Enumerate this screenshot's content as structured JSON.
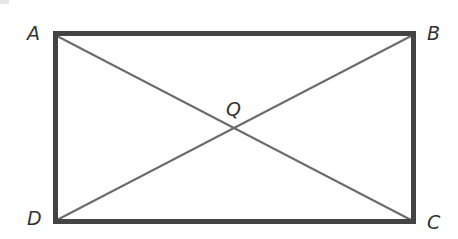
{
  "diagram": {
    "type": "geometry",
    "shape": "rectangle",
    "colors": {
      "border": "#444444",
      "diagonal": "#6b6b6b",
      "label": "#333333",
      "background": "#ffffff"
    },
    "vertices": [
      {
        "name": "A",
        "x": 53,
        "y": 33
      },
      {
        "name": "B",
        "x": 415,
        "y": 33
      },
      {
        "name": "C",
        "x": 415,
        "y": 223
      },
      {
        "name": "D",
        "x": 53,
        "y": 223
      }
    ],
    "intersection": {
      "name": "Q",
      "x": 234,
      "y": 128
    },
    "segments": [
      {
        "from": "A",
        "to": "B",
        "kind": "side"
      },
      {
        "from": "B",
        "to": "C",
        "kind": "side"
      },
      {
        "from": "C",
        "to": "D",
        "kind": "side"
      },
      {
        "from": "D",
        "to": "A",
        "kind": "side"
      },
      {
        "from": "A",
        "to": "C",
        "kind": "diagonal"
      },
      {
        "from": "B",
        "to": "D",
        "kind": "diagonal"
      }
    ],
    "labels": {
      "A": "A",
      "B": "B",
      "C": "C",
      "D": "D",
      "Q": "Q"
    }
  }
}
